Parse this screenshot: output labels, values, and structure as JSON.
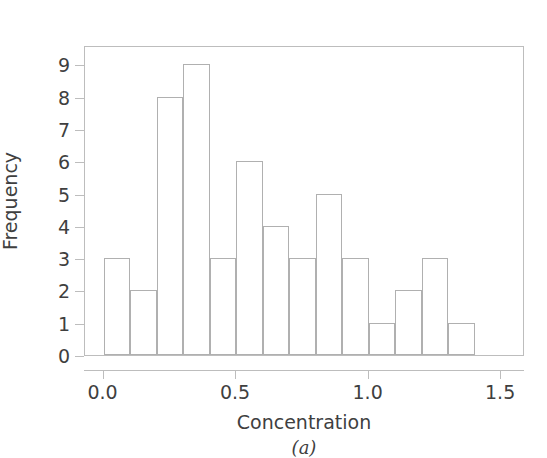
{
  "chart_data": {
    "type": "bar",
    "title": "",
    "subtitle": "",
    "xlabel": "Concentration",
    "ylabel": "Frequency",
    "caption": "(a)",
    "grid": false,
    "legend": null,
    "bin_width": 0.1,
    "bin_starts": [
      0.0,
      0.1,
      0.2,
      0.3,
      0.4,
      0.5,
      0.6,
      0.7,
      0.8,
      0.9,
      1.0,
      1.1,
      1.2,
      1.3
    ],
    "categories": [
      "0.0-0.1",
      "0.1-0.2",
      "0.2-0.3",
      "0.3-0.4",
      "0.4-0.5",
      "0.5-0.6",
      "0.6-0.7",
      "0.7-0.8",
      "0.8-0.9",
      "0.9-1.0",
      "1.0-1.1",
      "1.1-1.2",
      "1.2-1.3",
      "1.3-1.4"
    ],
    "values": [
      3,
      2,
      8,
      9,
      3,
      6,
      4,
      3,
      5,
      3,
      1,
      2,
      3,
      1
    ],
    "xlim": [
      -0.07,
      1.59
    ],
    "ylim": [
      0,
      9.6
    ],
    "xticks": [
      0.0,
      0.5,
      1.0,
      1.5
    ],
    "xticklabels": [
      "0.0",
      "0.5",
      "1.0",
      "1.5"
    ],
    "yticks": [
      0,
      1,
      2,
      3,
      4,
      5,
      6,
      7,
      8,
      9
    ],
    "yticklabels": [
      "0",
      "1",
      "2",
      "3",
      "4",
      "5",
      "6",
      "7",
      "8",
      "9"
    ],
    "bar_edge_color": "#b0b0b0",
    "bar_fill_color": "#ffffff",
    "frame_color": "#bdbdbd",
    "text_color": "#3f3f3f",
    "background_color": "#ffffff"
  }
}
